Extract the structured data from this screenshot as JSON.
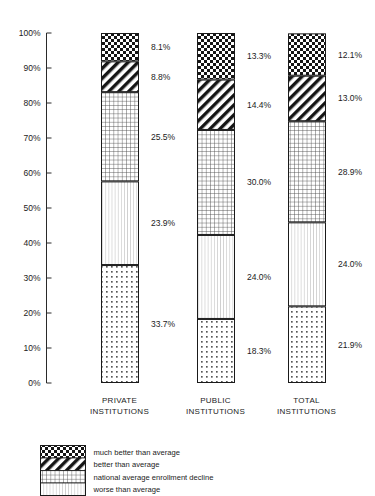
{
  "chart_data": {
    "type": "bar",
    "subtype": "stacked-100-percent",
    "title": "",
    "subtitle": "",
    "xlabel": "",
    "ylabel": "",
    "ylim": [
      0,
      100
    ],
    "grid": false,
    "legend_position": "bottom-left",
    "orientation": "vertical",
    "categories": [
      "PRIVATE INSTITUTIONS",
      "PUBLIC INSTITUTIONS",
      "TOTAL INSTITUTIONS"
    ],
    "category_lines": [
      [
        "PRIVATE",
        "INSTITUTIONS"
      ],
      [
        "PUBLIC",
        "INSTITUTIONS"
      ],
      [
        "TOTAL",
        "INSTITUTIONS"
      ]
    ],
    "ytick_labels": [
      "100%",
      "90%",
      "80%",
      "70%",
      "60%",
      "50%",
      "40%",
      "30%",
      "20%",
      "10%",
      "0%"
    ],
    "ytick_values": [
      100,
      90,
      80,
      70,
      60,
      50,
      40,
      30,
      20,
      10,
      0
    ],
    "series": [
      {
        "name": "much better than average",
        "pattern": "checkerboard",
        "values": [
          8.1,
          13.3,
          12.1
        ],
        "labels": [
          "8.1%",
          "13.3%",
          "12.1%"
        ]
      },
      {
        "name": "better than average",
        "pattern": "diagonal-stripes",
        "values": [
          8.8,
          14.4,
          13.0
        ],
        "labels": [
          "8.8%",
          "14.4%",
          "13.0%"
        ]
      },
      {
        "name": "national average enrollment decline",
        "pattern": "fine-grid",
        "values": [
          25.5,
          30.0,
          28.9
        ],
        "labels": [
          "25.5%",
          "30.0%",
          "28.9%"
        ]
      },
      {
        "name": "worse than average",
        "pattern": "vertical-lines",
        "values": [
          23.9,
          24.0,
          24.0
        ],
        "labels": [
          "23.9%",
          "24.0%",
          "24.0%"
        ]
      },
      {
        "name": "",
        "pattern": "dots",
        "values": [
          33.7,
          18.3,
          21.9
        ],
        "labels": [
          "33.7%",
          "18.3%",
          "21.9%"
        ]
      }
    ]
  },
  "legend": {
    "entries": [
      {
        "label": "much better than average",
        "pattern": "checkerboard"
      },
      {
        "label": "better than average",
        "pattern": "diagonal-stripes"
      },
      {
        "label": "national average enrollment decline",
        "pattern": "fine-grid"
      },
      {
        "label": "worse than average",
        "pattern": "vertical-lines"
      }
    ]
  },
  "colors": {
    "ink": "#1a1a1a",
    "background": "#ffffff",
    "axis": "#2a2a2a"
  }
}
